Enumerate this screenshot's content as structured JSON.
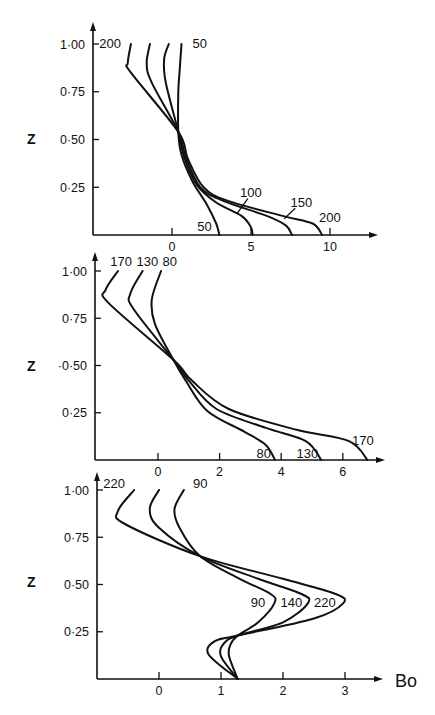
{
  "chart_data": [
    {
      "type": "line",
      "panel": "top",
      "ylabel": "Z",
      "xlabel": "",
      "yticks": [
        "1·00",
        "0·75",
        "0·50",
        "0·25"
      ],
      "ytick_values": [
        1.0,
        0.75,
        0.5,
        0.25
      ],
      "xticks": [
        "0",
        "5",
        "10"
      ],
      "xtick_values": [
        0,
        5,
        10
      ],
      "xlim": [
        -5,
        13
      ],
      "ylim": [
        0,
        1.08
      ],
      "grid": false,
      "legend": "inline curve labels",
      "series": [
        {
          "name": "50",
          "x": [
            0.6,
            0.5,
            0.4,
            0.4,
            0.6,
            1.3,
            2.2,
            2.8,
            3.0
          ],
          "z": [
            1.0,
            0.88,
            0.75,
            0.54,
            0.42,
            0.28,
            0.16,
            0.06,
            0.0
          ]
        },
        {
          "name": "100",
          "x": [
            -0.2,
            -0.5,
            -0.4,
            0.4,
            0.8,
            1.6,
            2.8,
            4.4,
            5.0,
            5.1
          ],
          "z": [
            1.0,
            0.92,
            0.8,
            0.54,
            0.4,
            0.26,
            0.17,
            0.1,
            0.04,
            0.0
          ]
        },
        {
          "name": "150",
          "x": [
            -1.4,
            -1.6,
            -1.3,
            0.4,
            0.9,
            1.8,
            3.2,
            6.0,
            7.2,
            7.6
          ],
          "z": [
            1.0,
            0.9,
            0.8,
            0.54,
            0.4,
            0.25,
            0.18,
            0.1,
            0.05,
            0.0
          ]
        },
        {
          "name": "200",
          "x": [
            -2.6,
            -2.8,
            -2.6,
            0.4,
            1.0,
            2.0,
            3.5,
            7.0,
            8.9,
            9.5
          ],
          "z": [
            1.0,
            0.9,
            0.85,
            0.54,
            0.4,
            0.25,
            0.18,
            0.1,
            0.06,
            0.0
          ]
        }
      ],
      "labels": [
        {
          "text": "200",
          "x": -4.6,
          "z": 1.0
        },
        {
          "text": "50",
          "x": 1.3,
          "z": 1.0
        },
        {
          "text": "100",
          "x": 4.3,
          "z": 0.22
        },
        {
          "text": "150",
          "x": 7.5,
          "z": 0.17
        },
        {
          "text": "200",
          "x": 9.3,
          "z": 0.09
        },
        {
          "text": "50",
          "x": 1.6,
          "z": 0.04
        }
      ]
    },
    {
      "type": "line",
      "panel": "middle",
      "ylabel": "Z",
      "xlabel": "",
      "yticks": [
        "1·00",
        "0·75",
        "·0·50",
        "0·25"
      ],
      "ytick_values": [
        1.0,
        0.75,
        0.5,
        0.25
      ],
      "xticks": [
        "0",
        "2",
        "4",
        "6"
      ],
      "xtick_values": [
        0,
        2,
        4,
        6
      ],
      "xlim": [
        -2.05,
        7.4
      ],
      "ylim": [
        0,
        1.1
      ],
      "grid": false,
      "legend": "inline curve labels",
      "series": [
        {
          "name": "80",
          "x": [
            0.1,
            -0.2,
            -0.1,
            0.5,
            0.9,
            1.6,
            2.8,
            3.5,
            3.8
          ],
          "z": [
            1.0,
            0.85,
            0.72,
            0.53,
            0.42,
            0.26,
            0.15,
            0.08,
            0.0
          ]
        },
        {
          "name": "130",
          "x": [
            -0.5,
            -0.9,
            -0.8,
            0.5,
            1.0,
            1.9,
            3.5,
            4.8,
            5.3
          ],
          "z": [
            1.0,
            0.88,
            0.8,
            0.53,
            0.42,
            0.27,
            0.17,
            0.1,
            0.0
          ]
        },
        {
          "name": "170",
          "x": [
            -1.3,
            -1.7,
            -1.6,
            0.5,
            1.1,
            2.3,
            4.5,
            6.2,
            6.8
          ],
          "z": [
            1.0,
            0.9,
            0.83,
            0.53,
            0.42,
            0.27,
            0.16,
            0.1,
            0.0
          ]
        }
      ],
      "labels": [
        {
          "text": "170",
          "x": -1.55,
          "z": 1.05
        },
        {
          "text": "130",
          "x": -0.7,
          "z": 1.05
        },
        {
          "text": "80",
          "x": 0.15,
          "z": 1.05
        },
        {
          "text": "80",
          "x": 3.2,
          "z": 0.03
        },
        {
          "text": "130",
          "x": 4.5,
          "z": 0.03
        },
        {
          "text": "170",
          "x": 6.3,
          "z": 0.1
        }
      ]
    },
    {
      "type": "line",
      "panel": "bottom",
      "ylabel": "Z",
      "xlabel": "Bo",
      "yticks": [
        "1·00",
        "0·75",
        "0·50",
        "0·25"
      ],
      "ytick_values": [
        1.0,
        0.75,
        0.5,
        0.25
      ],
      "xticks": [
        "0",
        "1",
        "2",
        "3"
      ],
      "xtick_values": [
        0,
        1,
        2,
        3
      ],
      "xlim": [
        -1.0,
        3.6
      ],
      "ylim": [
        0,
        1.1
      ],
      "grid": false,
      "legend": "inline curve labels",
      "series": [
        {
          "name": "90",
          "x": [
            0.4,
            0.25,
            0.33,
            0.66,
            1.3,
            1.8,
            1.86,
            1.6,
            1.27,
            1.15,
            1.13,
            1.27
          ],
          "z": [
            1.0,
            0.9,
            0.8,
            0.65,
            0.53,
            0.45,
            0.4,
            0.3,
            0.23,
            0.18,
            0.12,
            0.0
          ]
        },
        {
          "name": "140",
          "x": [
            0.0,
            -0.15,
            0.0,
            0.66,
            1.6,
            2.3,
            2.4,
            2.0,
            1.27,
            1.05,
            1.0,
            1.27
          ],
          "z": [
            1.0,
            0.9,
            0.8,
            0.65,
            0.53,
            0.45,
            0.4,
            0.3,
            0.23,
            0.19,
            0.12,
            0.0
          ]
        },
        {
          "name": "220",
          "x": [
            -0.4,
            -0.66,
            -0.55,
            0.66,
            2.0,
            2.85,
            2.97,
            2.5,
            1.27,
            0.9,
            0.8,
            1.27
          ],
          "z": [
            1.0,
            0.89,
            0.82,
            0.65,
            0.53,
            0.45,
            0.4,
            0.32,
            0.23,
            0.2,
            0.13,
            0.0
          ]
        }
      ],
      "labels": [
        {
          "text": "220",
          "x": -0.9,
          "z": 1.03
        },
        {
          "text": "90",
          "x": 0.55,
          "z": 1.03
        },
        {
          "text": "90",
          "x": 1.48,
          "z": 0.4
        },
        {
          "text": "140",
          "x": 1.96,
          "z": 0.4
        },
        {
          "text": "220",
          "x": 2.5,
          "z": 0.4
        }
      ]
    }
  ],
  "figure": {
    "z_label": "Z",
    "x_axis_label": "Bo"
  }
}
